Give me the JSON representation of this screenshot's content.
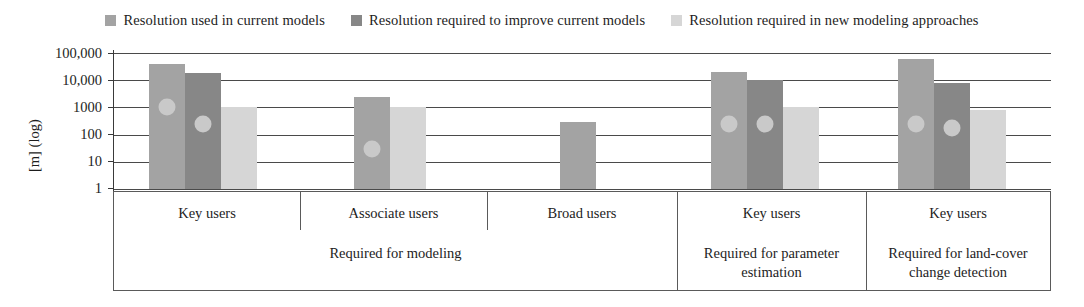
{
  "chart_data": {
    "type": "bar",
    "title": "",
    "xlabel": "",
    "ylabel": "[m] (log)",
    "ylim": [
      1,
      100000
    ],
    "yscale": "log",
    "grid": true,
    "legend_position": "top-center",
    "ytick_labels": [
      "100,000",
      "10,000",
      "1000",
      "100",
      "10",
      "1"
    ],
    "ytick_values": [
      100000,
      10000,
      1000,
      100,
      10,
      1
    ],
    "legend": [
      {
        "label": "Resolution used in current models",
        "color": "#a3a3a3"
      },
      {
        "label": "Resolution required to improve current models",
        "color": "#878787"
      },
      {
        "label": "Resolution required in new modeling approaches",
        "color": "#d6d6d6"
      }
    ],
    "series": [
      {
        "name": "Resolution used in current models",
        "color": "#a3a3a3",
        "values": [
          40000,
          2500,
          300,
          20000,
          60000
        ]
      },
      {
        "name": "Resolution required to improve current models",
        "color": "#878787",
        "values": [
          18000,
          null,
          null,
          10000,
          8000
        ]
      },
      {
        "name": "Resolution required in new modeling approaches",
        "color": "#d6d6d6",
        "values": [
          1000,
          1000,
          null,
          1000,
          800
        ]
      }
    ],
    "categories": [
      "Key users",
      "Associate users",
      "Broad users",
      "Key users",
      "Key users"
    ],
    "markers": [
      {
        "group": 0,
        "series": 0,
        "value": 1000,
        "color": "#c9c9c9"
      },
      {
        "group": 0,
        "series": 1,
        "value": 250,
        "color": "#c9c9c9"
      },
      {
        "group": 1,
        "series": 0,
        "value": 30,
        "color": "#c9c9c9"
      },
      {
        "group": 3,
        "series": 0,
        "value": 250,
        "color": "#c9c9c9"
      },
      {
        "group": 3,
        "series": 1,
        "value": 250,
        "color": "#c9c9c9"
      },
      {
        "group": 4,
        "series": 0,
        "value": 250,
        "color": "#c9c9c9"
      },
      {
        "group": 4,
        "series": 1,
        "value": 180,
        "color": "#c9c9c9"
      }
    ],
    "group_labels": [
      {
        "label": "Required for modeling",
        "spans": [
          0,
          1,
          2
        ]
      },
      {
        "label": "Required for parameter estimation",
        "spans": [
          3
        ]
      },
      {
        "label": "Required for land-cover change detection",
        "spans": [
          4
        ]
      }
    ]
  },
  "axis": {
    "y_title": "[m] (log)",
    "ticks": [
      "100,000",
      "10,000",
      "1000",
      "100",
      "10",
      "1"
    ]
  },
  "legend": {
    "items": [
      "Resolution used in current models",
      "Resolution required to improve current models",
      "Resolution required in new modeling approaches"
    ]
  },
  "categories": {
    "cat0": "Key users",
    "cat1": "Associate users",
    "cat2": "Broad users",
    "cat3": "Key users",
    "cat4": "Key users"
  },
  "groups": {
    "g0": "Required for modeling",
    "g1_line1": "Required for parameter",
    "g1_line2": "estimation",
    "g2_line1": "Required for land-cover",
    "g2_line2": "change detection"
  }
}
